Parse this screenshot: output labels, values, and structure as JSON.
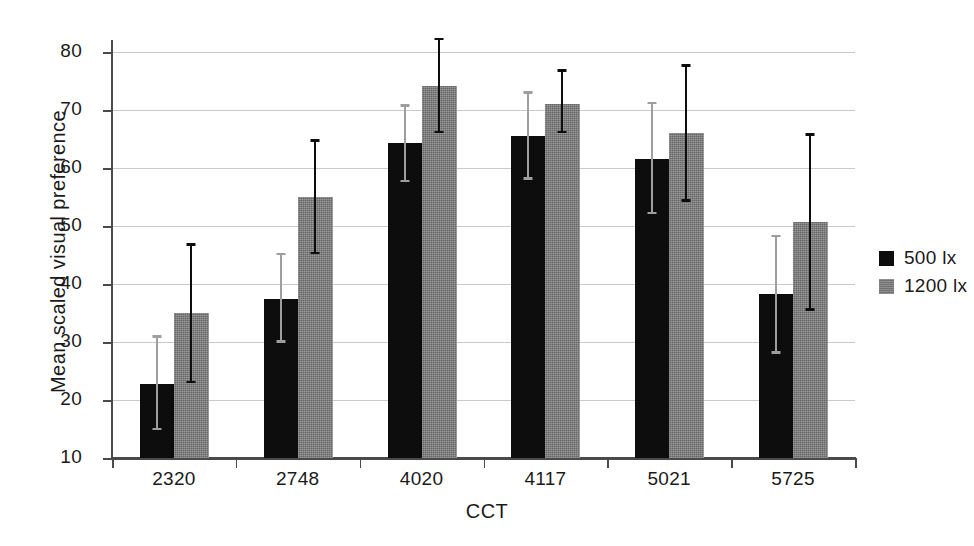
{
  "chart_data": {
    "type": "bar",
    "title": "",
    "xlabel": "CCT",
    "ylabel": "Mean scaled visual preference",
    "categories": [
      "2320",
      "2748",
      "4020",
      "4117",
      "5021",
      "5725"
    ],
    "ylim": [
      10,
      80
    ],
    "yticks": [
      10,
      20,
      30,
      40,
      50,
      60,
      70,
      80
    ],
    "ytick_labels": [
      "10",
      "20",
      "30",
      "40",
      "50",
      "60",
      "70",
      "80"
    ],
    "grid": true,
    "legend_position": "right",
    "series": [
      {
        "name": "500 lx",
        "color": "#0d0d0d",
        "values": [
          22.8,
          37.5,
          64.3,
          65.5,
          61.5,
          38.3
        ],
        "error_low": [
          14.8,
          29.9,
          57.5,
          58.0,
          52.0,
          28.0
        ],
        "error_high": [
          31.2,
          45.4,
          71.0,
          73.2,
          71.4,
          48.5
        ],
        "errorbar_color": "#9e9e9e"
      },
      {
        "name": "1200 lx",
        "color": "#808080",
        "values": [
          35.0,
          55.0,
          74.2,
          71.1,
          66.0,
          50.7
        ],
        "error_low": [
          22.9,
          45.1,
          66.0,
          66.0,
          54.2,
          35.4
        ],
        "error_high": [
          47.0,
          65.0,
          82.5,
          77.0,
          77.9,
          66.0
        ],
        "errorbar_color": "#0d0d0d"
      }
    ]
  },
  "axes": {
    "x_title": "CCT",
    "y_title": "Mean scaled visual preference"
  },
  "legend": {
    "entries": [
      {
        "label": "500 lx"
      },
      {
        "label": "1200 lx"
      }
    ]
  }
}
